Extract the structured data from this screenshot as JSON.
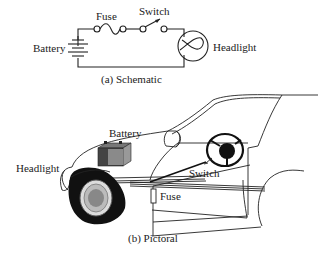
{
  "schematic": {
    "caption": "(a) Schematic",
    "labels": {
      "fuse": "Fuse",
      "switch": "Switch",
      "battery": "Battery",
      "headlight": "Headlight"
    }
  },
  "pictorial": {
    "caption": "(b) Pictoral",
    "labels": {
      "battery": "Battery",
      "headlight": "Headlight",
      "switch": "Switch",
      "fuse": "Fuse"
    }
  },
  "colors": {
    "line": "#222222",
    "background": "#ffffff"
  }
}
